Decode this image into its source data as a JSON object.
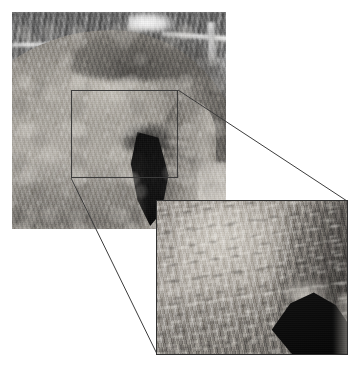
{
  "figure": {
    "caption": "",
    "background_color": "#ffffff",
    "width": 357,
    "height": 365,
    "color_mode": "grayscale"
  },
  "main_photo": {
    "label": "Grayscale photograph of the hindquarters of a grey horse showing the rump, tail and hind leg",
    "subject": "horse hindquarters",
    "x": 12,
    "y": 12,
    "width": 214,
    "height": 217,
    "regions": [
      {
        "name": "blurred-background-trees-and-fence",
        "description": "Out-of-focus dark tree trunks and pale fence rails across the top of the frame"
      },
      {
        "name": "rump",
        "description": "Large rounded grey rump filling the left and centre of the frame"
      },
      {
        "name": "dorsal-shadow",
        "description": "Dark shaded band along the top of the rump"
      },
      {
        "name": "tail",
        "description": "Dark, almost black tail hanging down at the centre-right"
      },
      {
        "name": "hind-leg",
        "description": "Hind leg and inner-thigh folds at the right of the frame"
      }
    ],
    "tones": {
      "highlight": "#d6d2ca",
      "midtone": "#9a968f",
      "shadow": "#5f5c58",
      "darkest": "#0a0a0a"
    }
  },
  "callout": {
    "label": "Region of interest box on the main photograph",
    "x": 71,
    "y": 90,
    "width": 107,
    "height": 88,
    "border_color": "#3c3c3c",
    "border_width_px": 1,
    "fill": "transparent"
  },
  "connectors": {
    "label": "Leader lines linking the region-of-interest box to the magnified inset",
    "stroke_color": "#3c3c3c",
    "stroke_width_px": 1,
    "lines": [
      {
        "name": "top-connector",
        "from": "callout-top-right",
        "x1": 178,
        "y1": 90,
        "x2": 347,
        "y2": 201
      },
      {
        "name": "bottom-connector",
        "from": "callout-bottom-left",
        "x1": 71,
        "y1": 178,
        "x2": 157,
        "y2": 354
      }
    ]
  },
  "inset_photo": {
    "label": "Magnified inset showing the fine coat hair texture of the boxed region",
    "x": 156,
    "y": 200,
    "width": 192,
    "height": 155,
    "border_color": "#2f2f2f",
    "border_width_px": 1,
    "regions": [
      {
        "name": "coat-hair-texture",
        "description": "Strongly magnified short grey coat hairs running diagonally, mottled light and dark"
      },
      {
        "name": "tail-wedge",
        "description": "Black wedge of the tail entering from the lower-right corner"
      },
      {
        "name": "bright-rim",
        "description": "Bright rim-lit hairs along the upper edge of the dark tail"
      }
    ],
    "tones": {
      "highlight": "#ded9d1",
      "midtone": "#a39e97",
      "shadow": "#5f5c58",
      "darkest": "#050505"
    }
  }
}
